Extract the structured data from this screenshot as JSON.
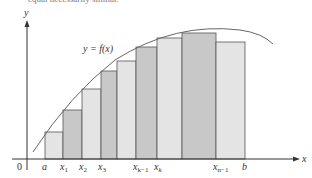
{
  "caption": "equal necessarily similar.",
  "axes": {
    "x_label": "x",
    "y_label": "y",
    "origin_label": "0"
  },
  "curve_label": "y = f(x)",
  "tick_labels": [
    {
      "text": "a",
      "sub": ""
    },
    {
      "text": "x",
      "sub": "1"
    },
    {
      "text": "x",
      "sub": "2"
    },
    {
      "text": "x",
      "sub": "3"
    },
    {
      "text": "x",
      "sub": "k−1"
    },
    {
      "text": "x",
      "sub": "k"
    },
    {
      "text": "x",
      "sub": "n−1"
    },
    {
      "text": "b",
      "sub": ""
    }
  ],
  "rectangles": [
    {
      "x0": 45,
      "x1": 63,
      "top": 132,
      "shade": "#e4e4e4"
    },
    {
      "x0": 63,
      "x1": 82,
      "top": 110,
      "shade": "#c8c8c8"
    },
    {
      "x0": 82,
      "x1": 101,
      "top": 89,
      "shade": "#e4e4e4"
    },
    {
      "x0": 101,
      "x1": 117,
      "top": 71,
      "shade": "#c8c8c8"
    },
    {
      "x0": 117,
      "x1": 136,
      "top": 61,
      "shade": "#e4e4e4"
    },
    {
      "x0": 136,
      "x1": 157,
      "top": 47,
      "shade": "#c8c8c8"
    },
    {
      "x0": 157,
      "x1": 182,
      "top": 38,
      "shade": "#e4e4e4"
    },
    {
      "x0": 182,
      "x1": 216,
      "top": 33,
      "shade": "#c8c8c8"
    },
    {
      "x0": 216,
      "x1": 245,
      "top": 42,
      "shade": "#e4e4e4"
    }
  ],
  "colors": {
    "axis": "#333333",
    "curve": "#666666",
    "rect_stroke": "#555555",
    "light": "#e4e4e4",
    "dark": "#c8c8c8"
  }
}
